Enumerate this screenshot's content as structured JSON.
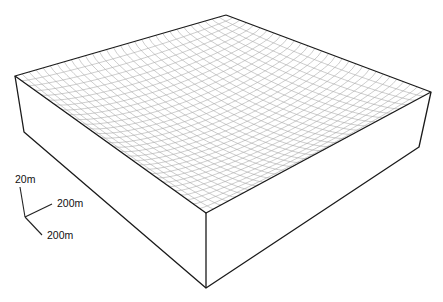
{
  "figure": {
    "colors": {
      "edges": "#1a1a1a",
      "mesh": "#9a9a9a",
      "background": "#ffffff"
    },
    "block": {
      "top_face": {
        "back": [
          226,
          15
        ],
        "left": [
          15,
          76
        ],
        "right": [
          431,
          92
        ],
        "front": [
          206,
          213
        ]
      },
      "bottom": {
        "left": [
          24,
          132
        ],
        "right": [
          419,
          147
        ],
        "front": [
          206,
          288
        ]
      },
      "mesh_divisions": 30,
      "basin_depth_px": 22
    }
  },
  "scale_bar": {
    "vertical_label": "20m",
    "depth_label": "200m",
    "width_label": "200m"
  }
}
